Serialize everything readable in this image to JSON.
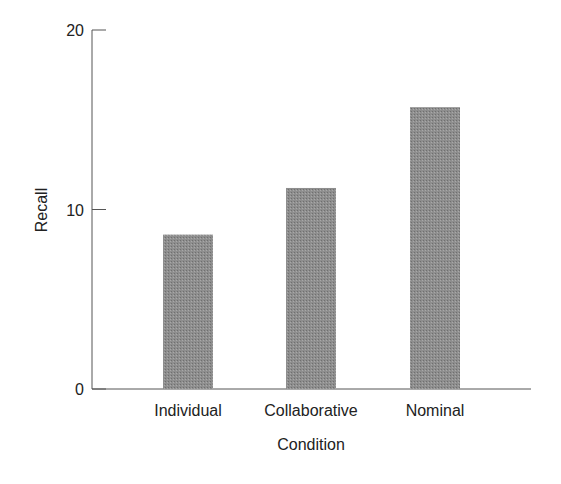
{
  "chart_data": {
    "type": "bar",
    "title": "",
    "xlabel": "Condition",
    "ylabel": "Recall",
    "categories": [
      "Individual",
      "Collaborative",
      "Nominal"
    ],
    "values": [
      8.6,
      11.2,
      15.7
    ],
    "ylim": [
      0,
      20
    ],
    "yticks": [
      0,
      10,
      20
    ],
    "grid": false,
    "legend": null,
    "bar_color": "#8c8c8c"
  }
}
